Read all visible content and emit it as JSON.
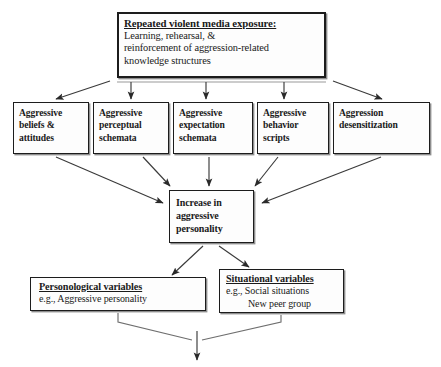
{
  "diagram": {
    "type": "flowchart",
    "background_color": "#ffffff",
    "line_color": "#333333",
    "box_border_color": "#1c1c1c",
    "partial_text_top": "",
    "nodes": {
      "exposure": {
        "heading": "Repeated violent media exposure:",
        "line1": "Learning, rehearsal, &",
        "line2": "reinforcement of aggression-related",
        "line3": "knowledge structures"
      },
      "beliefs": {
        "line1": "Aggressive",
        "line2": "beliefs &",
        "line3": "attitudes"
      },
      "perceptual": {
        "line1": "Aggressive",
        "line2": "perceptual",
        "line3": "schemata"
      },
      "expectation": {
        "line1": "Aggressive",
        "line2": "expectation",
        "line3": "schemata"
      },
      "scripts": {
        "line1": "Aggressive",
        "line2": "behavior",
        "line3": "scripts"
      },
      "desensitization": {
        "line1": "Aggression",
        "line2": "desensitization",
        "line3": ""
      },
      "increase": {
        "line1": "Increase in",
        "line2": "aggressive",
        "line3": "personality"
      },
      "personological": {
        "heading": "Personological variables",
        "line1": "e.g., Aggressive personality"
      },
      "situational": {
        "heading": "Situational variables",
        "line1": "e.g., Social situations",
        "line2": "New peer group"
      }
    },
    "edges": [
      {
        "from": "exposure",
        "to": "beliefs",
        "style": "diagonal-arrow"
      },
      {
        "from": "exposure",
        "to": "perceptual",
        "style": "vertical-arrow"
      },
      {
        "from": "exposure",
        "to": "expectation",
        "style": "vertical-arrow"
      },
      {
        "from": "exposure",
        "to": "scripts",
        "style": "vertical-arrow"
      },
      {
        "from": "exposure",
        "to": "desensitization",
        "style": "diagonal-arrow"
      },
      {
        "from": "beliefs",
        "to": "increase",
        "style": "diagonal-arrow"
      },
      {
        "from": "perceptual",
        "to": "increase",
        "style": "diagonal-arrow"
      },
      {
        "from": "expectation",
        "to": "increase",
        "style": "vertical-arrow"
      },
      {
        "from": "scripts",
        "to": "increase",
        "style": "diagonal-arrow"
      },
      {
        "from": "desensitization",
        "to": "increase",
        "style": "diagonal-arrow"
      },
      {
        "from": "increase",
        "to": "personological",
        "style": "diagonal-arrow"
      },
      {
        "from": "increase",
        "to": "situational",
        "style": "diagonal-arrow"
      },
      {
        "from": "personological+situational",
        "to": "outcome-below",
        "style": "merge-down-arrow"
      }
    ]
  }
}
